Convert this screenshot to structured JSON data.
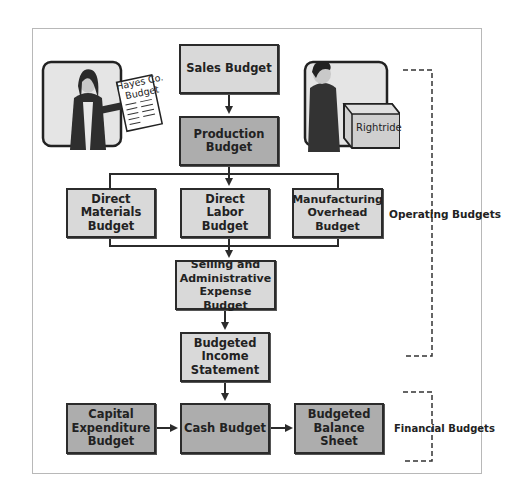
{
  "diagram": {
    "illustrations": {
      "woman_document_text": [
        "Hayes Co.",
        "Budget"
      ],
      "box_label": "Rightride"
    },
    "nodes": {
      "sales": [
        "Sales Budget"
      ],
      "production": [
        "Production",
        "Budget"
      ],
      "direct_materials": [
        "Direct",
        "Materials",
        "Budget"
      ],
      "direct_labor": [
        "Direct",
        "Labor",
        "Budget"
      ],
      "manufacturing_overhead": [
        "Manufacturing",
        "Overhead",
        "Budget"
      ],
      "selling_admin": [
        "Selling and",
        "Administrative",
        "Expense Budget"
      ],
      "income_statement": [
        "Budgeted",
        "Income",
        "Statement"
      ],
      "capital_expenditure": [
        "Capital",
        "Expenditure",
        "Budget"
      ],
      "cash": [
        "Cash Budget"
      ],
      "balance_sheet": [
        "Budgeted",
        "Balance",
        "Sheet"
      ]
    },
    "groups": {
      "operating": "Operating Budgets",
      "financial": "Financial Budgets"
    },
    "edges": [
      [
        "Sales Budget",
        "Production Budget"
      ],
      [
        "Production Budget",
        "Direct Materials Budget"
      ],
      [
        "Production Budget",
        "Direct Labor Budget"
      ],
      [
        "Production Budget",
        "Manufacturing Overhead Budget"
      ],
      [
        "Direct Materials/Labor/Overhead",
        "Selling and Administrative Expense Budget"
      ],
      [
        "Selling and Administrative Expense Budget",
        "Budgeted Income Statement"
      ],
      [
        "Budgeted Income Statement",
        "Cash Budget"
      ],
      [
        "Capital Expenditure Budget",
        "Cash Budget"
      ],
      [
        "Cash Budget",
        "Budgeted Balance Sheet"
      ]
    ],
    "colors": {
      "light_box": "#d9d9d9",
      "dark_box": "#adadad",
      "line": "#2b2b2b"
    }
  }
}
